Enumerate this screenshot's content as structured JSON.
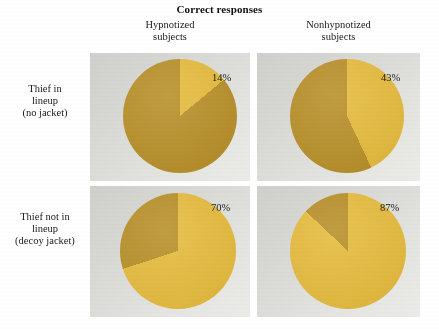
{
  "figure": {
    "title": "Correct responses",
    "colors": {
      "slice_light": "#e8bd3c",
      "slice_dark": "#bb9229",
      "panel_background": "#d9d9d5",
      "page_background": "#ffffff",
      "text": "#1a1a1a"
    }
  },
  "columns": [
    {
      "key": "hypnotized",
      "line1": "Hypnotized",
      "line2": "subjects"
    },
    {
      "key": "nonhypnotized",
      "line1": "Nonhypnotized",
      "line2": "subjects"
    }
  ],
  "rows": [
    {
      "key": "no_jacket",
      "line1": "Thief in",
      "line2": "lineup",
      "line3": "(no jacket)"
    },
    {
      "key": "decoy_jacket",
      "line1": "Thief not in",
      "line2": "lineup",
      "line3": "(decoy jacket)"
    }
  ],
  "cells": {
    "r1c1": {
      "percent_label": "14%"
    },
    "r1c2": {
      "percent_label": "43%"
    },
    "r2c1": {
      "percent_label": "70%"
    },
    "r2c2": {
      "percent_label": "87%"
    }
  },
  "chart_data": {
    "type": "pie",
    "title": "Correct responses",
    "xlabel": "",
    "ylabel": "",
    "units": "percent",
    "grid": false,
    "legend": "none",
    "note": "Four pie charts arranged in a 2x2 grid; each pie shows the percent of correct responses (light gold wedge, drawn clockwise from 12 o'clock) versus the remainder (dark gold wedge).",
    "row_categories": [
      "Thief in lineup (no jacket)",
      "Thief not in lineup (decoy jacket)"
    ],
    "column_categories": [
      "Hypnotized subjects",
      "Nonhypnotized subjects"
    ],
    "slice_labels": [
      "Correct responses",
      "Other responses"
    ],
    "charts": [
      {
        "id": "r1c1",
        "row": "Thief in lineup (no jacket)",
        "column": "Hypnotized subjects",
        "labels": [
          "Correct responses",
          "Other responses"
        ],
        "values": [
          14,
          86
        ],
        "data_label": "14%",
        "colors": [
          "#e8bd3c",
          "#bb9229"
        ]
      },
      {
        "id": "r1c2",
        "row": "Thief in lineup (no jacket)",
        "column": "Nonhypnotized subjects",
        "labels": [
          "Correct responses",
          "Other responses"
        ],
        "values": [
          43,
          57
        ],
        "data_label": "43%",
        "colors": [
          "#e8bd3c",
          "#bb9229"
        ]
      },
      {
        "id": "r2c1",
        "row": "Thief not in lineup (decoy jacket)",
        "column": "Hypnotized subjects",
        "labels": [
          "Correct responses",
          "Other responses"
        ],
        "values": [
          70,
          30
        ],
        "data_label": "70%",
        "colors": [
          "#e8bd3c",
          "#bb9229"
        ]
      },
      {
        "id": "r2c2",
        "row": "Thief not in lineup (decoy jacket)",
        "column": "Nonhypnotized subjects",
        "labels": [
          "Correct responses",
          "Other responses"
        ],
        "values": [
          87,
          13
        ],
        "data_label": "87%",
        "colors": [
          "#e8bd3c",
          "#bb9229"
        ]
      }
    ]
  }
}
